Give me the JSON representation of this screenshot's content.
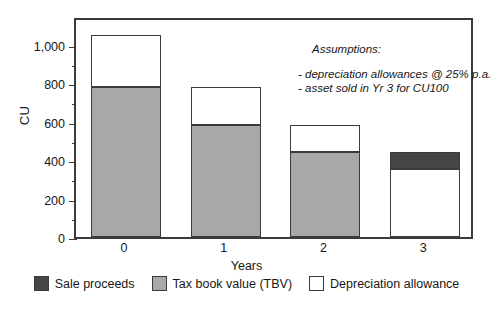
{
  "chart_data": {
    "type": "bar",
    "stacked": true,
    "title": "",
    "xlabel": "Years",
    "ylabel": "CU",
    "categories": [
      "0",
      "1",
      "2",
      "3"
    ],
    "ylim": [
      0,
      1150
    ],
    "ytick_labels": [
      "0",
      "200",
      "400",
      "600",
      "800",
      "1,000"
    ],
    "ytick_values": [
      0,
      200,
      400,
      600,
      800,
      1000
    ],
    "yminor_step": 100,
    "grid": false,
    "legend_position": "bottom",
    "series": [
      {
        "name": "Sale proceeds",
        "color": "#454545",
        "values": [
          0,
          0,
          0,
          90
        ]
      },
      {
        "name": "Tax book value (TBV)",
        "color": "#a8a8a8",
        "values": [
          780,
          585,
          440,
          0
        ]
      },
      {
        "name": "Depreciation allowance",
        "color": "#ffffff",
        "values": [
          270,
          195,
          145,
          355
        ]
      }
    ],
    "bar_totals": [
      1050,
      780,
      585,
      445
    ],
    "annotations": {
      "title": "Assumptions:",
      "lines": [
        "- depreciation allowances @ 25% p.a.",
        "- asset sold in Yr 3 for CU100"
      ]
    }
  },
  "legend": {
    "items": [
      {
        "label": "Sale proceeds",
        "color": "#454545"
      },
      {
        "label": "Tax book value (TBV)",
        "color": "#a8a8a8"
      },
      {
        "label": "Depreciation allowance",
        "color": "#ffffff"
      }
    ]
  },
  "colors": {
    "sale_proceeds": "#454545",
    "tax_book_value": "#a8a8a8",
    "depreciation_allowance": "#ffffff",
    "axis": "#3b3b3b",
    "text": "#171717",
    "background": "#ffffff"
  }
}
